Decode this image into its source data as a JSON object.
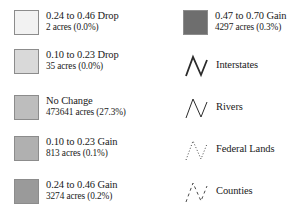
{
  "legend": {
    "left_column": [
      {
        "swatch_color": "#f2f2f2",
        "label": "0.24 to 0.46 Drop",
        "sub": "2 acres (0.0%)",
        "name": "drop-024-046"
      },
      {
        "swatch_color": "#d9d9d9",
        "label": "0.10 to 0.23 Drop",
        "sub": "35 acres (0.0%)",
        "name": "drop-010-023"
      },
      {
        "swatch_color": "#bdbdbd",
        "label": "No Change",
        "sub": "473641 acres (27.3%)",
        "name": "no-change"
      },
      {
        "swatch_color": "#b0b0b0",
        "label": "0.10 to 0.23 Gain",
        "sub": "813 acres (0.1%)",
        "name": "gain-010-023"
      },
      {
        "swatch_color": "#9a9a9a",
        "label": "0.24 to 0.46 Gain",
        "sub": "3274 acres (0.2%)",
        "name": "gain-024-046"
      }
    ],
    "right_column": [
      {
        "kind": "swatch",
        "swatch_color": "#6e6e6e",
        "label": "0.47 to 0.70 Gain",
        "sub": "4297 acres (0.3%)",
        "name": "gain-047-070"
      },
      {
        "kind": "line",
        "label": "Interstates",
        "line_style": "solid",
        "line_width": "1.8",
        "line_color": "#2b2b2b",
        "name": "interstates"
      },
      {
        "kind": "line",
        "label": "Rivers",
        "line_style": "solid",
        "line_width": "1.0",
        "line_color": "#2b2b2b",
        "name": "rivers"
      },
      {
        "kind": "line",
        "label": "Federal Lands",
        "line_style": "dotted",
        "line_width": "1.0",
        "line_color": "#4a4a4a",
        "name": "federal-lands"
      },
      {
        "kind": "line",
        "label": "Counties",
        "line_style": "dashed",
        "line_width": "1.0",
        "line_color": "#4a4a4a",
        "name": "counties"
      }
    ]
  }
}
